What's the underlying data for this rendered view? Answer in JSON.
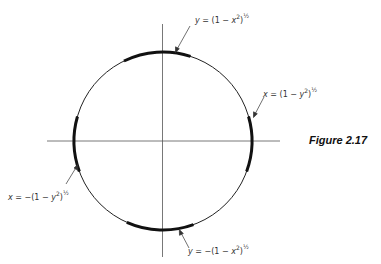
{
  "figure": {
    "caption": "Figure 2.17",
    "labels": [
      {
        "id": "top",
        "var": "y",
        "eq": "=",
        "sign": "",
        "open": "(1 − ",
        "arg": "x",
        "exp2": "2",
        "close": ")",
        "power": "½",
        "text": "y = (1 − x²)^½"
      },
      {
        "id": "right",
        "var": "x",
        "eq": "=",
        "sign": "",
        "open": "(1 − ",
        "arg": "y",
        "exp2": "2",
        "close": ")",
        "power": "½",
        "text": "x = (1 − y²)^½"
      },
      {
        "id": "left",
        "var": "x",
        "eq": "=",
        "sign": "−",
        "open": "(1 − ",
        "arg": "y",
        "exp2": "2",
        "close": ")",
        "power": "½",
        "text": "x = −(1 − y²)^½"
      },
      {
        "id": "bottom",
        "var": "y",
        "eq": "=",
        "sign": "−",
        "open": "(1 − ",
        "arg": "x",
        "exp2": "2",
        "close": ")",
        "power": "½",
        "text": "y = −(1 − x²)^½"
      }
    ],
    "colors": {
      "line": "#111111",
      "axis": "#444444",
      "text": "#333333"
    }
  }
}
